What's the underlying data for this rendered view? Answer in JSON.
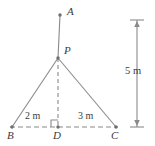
{
  "figure": {
    "type": "geometry-diagram",
    "width": 155,
    "height": 146,
    "background_color": "#ffffff",
    "stroke_color": "#808080",
    "text_color": "#3b3b3b",
    "points": [
      {
        "id": "A",
        "label": "A",
        "x": 60,
        "y": 15,
        "label_x": 67,
        "label_y": 7,
        "has_dot": true
      },
      {
        "id": "P",
        "label": "P",
        "x": 58,
        "y": 58,
        "label_x": 64,
        "label_y": 46,
        "has_dot": true
      },
      {
        "id": "B",
        "label": "B",
        "x": 12,
        "y": 127,
        "label_x": 8,
        "label_y": 130,
        "has_dot": true
      },
      {
        "id": "D",
        "label": "D",
        "x": 58,
        "y": 127,
        "label_x": 54,
        "label_y": 130,
        "has_dot": true
      },
      {
        "id": "C",
        "label": "C",
        "x": 116,
        "y": 127,
        "label_x": 112,
        "label_y": 130,
        "has_dot": true
      }
    ],
    "segments": [
      {
        "id": "A-P",
        "from": "A",
        "to": "P",
        "style": "solid"
      },
      {
        "id": "P-D",
        "from": "P",
        "to": "D",
        "style": "dashed"
      },
      {
        "id": "P-B",
        "from": "P",
        "to": "B",
        "style": "solid"
      },
      {
        "id": "P-C",
        "from": "P",
        "to": "C",
        "style": "solid"
      },
      {
        "id": "B-D",
        "from": "B",
        "to": "D",
        "style": "dashed"
      },
      {
        "id": "D-C",
        "from": "D",
        "to": "C",
        "style": "dashed"
      }
    ],
    "right_angle": {
      "at": "D",
      "size": 7
    },
    "dimensions": [
      {
        "id": "BD",
        "label": "2 m",
        "label_x": 25,
        "label_y": 112,
        "orientation": "horizontal"
      },
      {
        "id": "DC",
        "label": "3 m",
        "label_x": 78,
        "label_y": 112,
        "orientation": "horizontal"
      },
      {
        "id": "vertical",
        "label": "5 m",
        "label_x": 127,
        "label_y": 66,
        "orientation": "vertical",
        "line_x": 137,
        "top_y": 20,
        "bottom_y": 127,
        "tick_half_width": 7
      }
    ]
  }
}
